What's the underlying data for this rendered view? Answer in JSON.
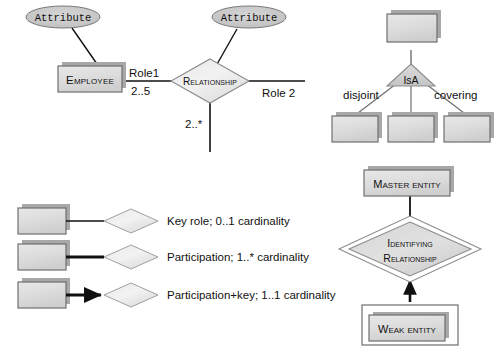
{
  "diagram": {
    "palette": {
      "entity_fill": "#d4d4d4",
      "entity_fill_light": "#e3e3e3",
      "entity_stroke": "#6f6f6f",
      "shadow": "#a8a8a8",
      "diamond_fill": "#e6e6e6",
      "diamond_fill_light": "#f4f4f4",
      "diamond_stroke": "#8c8c8c",
      "triangle_fill": "#cfcfcf",
      "ellipse_fill": "#c9c9c9",
      "line": "#1a1a1a",
      "text": "#111111"
    }
  },
  "relationship_panel": {
    "attribute_left": "Attribute",
    "attribute_right": "Attribute",
    "entity": "Employee",
    "relationship": "Relationship",
    "role_left": "Role1",
    "cardinality_left": "2..5",
    "role_right": "Role 2",
    "cardinality_bottom": "2..*"
  },
  "isa_panel": {
    "triangle_label": "IsA",
    "constraint_left": "disjoint",
    "constraint_right": "covering",
    "superclass": "",
    "subclasses": [
      "",
      "",
      ""
    ]
  },
  "legend_panel": {
    "rows": [
      {
        "style": "thin-line",
        "text": "Key role; 0..1 cardinality"
      },
      {
        "style": "thick-line",
        "text": "Participation; 1..* cardinality"
      },
      {
        "style": "thick-arrow",
        "text": "Participation+key; 1..1 cardinality"
      }
    ]
  },
  "weak_panel": {
    "master_entity": "Master entity",
    "identifying_relationship_line1": "Identifying",
    "identifying_relationship_line2": "Relationship",
    "weak_entity": "Weak entity"
  }
}
